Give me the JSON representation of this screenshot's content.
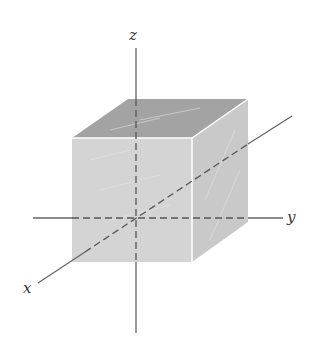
{
  "diagram": {
    "type": "3d-axes-with-cube",
    "axes": {
      "x_label": "x",
      "y_label": "y",
      "z_label": "z"
    },
    "colors": {
      "front_face": "#d2d2d2",
      "side_face": "#c6c6c6",
      "top_face": "#9e9e9e",
      "axis": "#555555"
    }
  }
}
